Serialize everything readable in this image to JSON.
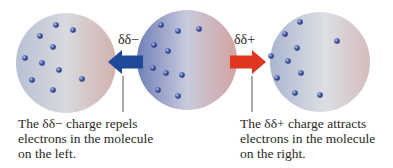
{
  "diagram": {
    "molecules": [
      {
        "name": "left-molecule",
        "cx": 66,
        "cy": 63,
        "r": 50,
        "gradient": [
          "#b7c1d4",
          "#d9d9de",
          "#d2b2ae"
        ],
        "electrons": [
          [
            56,
            25
          ],
          [
            73,
            30
          ],
          [
            40,
            36
          ],
          [
            53,
            47
          ],
          [
            25,
            58
          ],
          [
            42,
            63
          ],
          [
            59,
            70
          ],
          [
            82,
            79
          ],
          [
            32,
            80
          ],
          [
            53,
            90
          ]
        ]
      },
      {
        "name": "middle-molecule",
        "cx": 187,
        "cy": 60,
        "r": 50,
        "gradient": [
          "#6f7fb8",
          "#c8cbdd",
          "#d4a29f"
        ],
        "electrons": [
          [
            161,
            25
          ],
          [
            178,
            31
          ],
          [
            199,
            29
          ],
          [
            154,
            45
          ],
          [
            168,
            51
          ],
          [
            153,
            68
          ],
          [
            166,
            73
          ],
          [
            182,
            75
          ],
          [
            158,
            90
          ],
          [
            178,
            96
          ]
        ]
      },
      {
        "name": "right-molecule",
        "cx": 320,
        "cy": 62,
        "r": 50,
        "gradient": [
          "#aab6cf",
          "#dddfe4",
          "#d4bcbb"
        ],
        "electrons": [
          [
            300,
            22
          ],
          [
            285,
            34
          ],
          [
            337,
            41
          ],
          [
            297,
            48
          ],
          [
            271,
            56
          ],
          [
            288,
            61
          ],
          [
            301,
            73
          ],
          [
            277,
            78
          ],
          [
            295,
            93
          ],
          [
            320,
            95
          ]
        ]
      }
    ],
    "arrows": [
      {
        "name": "repel-arrow",
        "direction": "left",
        "color": "#1f4a9a",
        "x1": 143,
        "x2": 108,
        "y": 62
      },
      {
        "name": "attract-arrow",
        "direction": "right",
        "color": "#e0361f",
        "x1": 230,
        "x2": 266,
        "y": 62
      }
    ],
    "leader_lines": [
      {
        "name": "left-leader-line",
        "x": 123,
        "y1": 76,
        "y2": 112
      },
      {
        "name": "right-leader-line",
        "x": 252,
        "y1": 76,
        "y2": 112
      }
    ],
    "charge_labels": {
      "negative": "δδ−",
      "positive": "δδ+"
    },
    "captions": {
      "left": "The δδ− charge repels\nelectrons in the molecule\non the left.",
      "right": "The δδ+ charge attracts\nelectrons in the molecule\non the right."
    },
    "colors": {
      "electron_fill": "#2d3f8f",
      "electron_highlight": "#c9d2f0",
      "text": "#2a2a2a",
      "leader_line": "#555555"
    }
  }
}
